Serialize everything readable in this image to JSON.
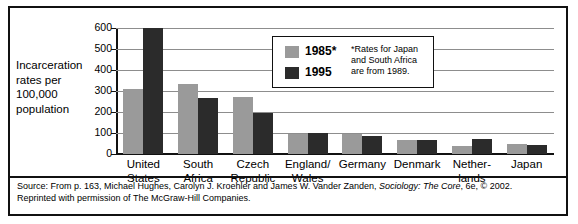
{
  "chart_data": {
    "type": "bar",
    "title": "",
    "xlabel": "",
    "ylabel": "Incarceration rates per 100,000 population",
    "ylim": [
      0,
      600
    ],
    "yticks": [
      0,
      100,
      200,
      300,
      400,
      500,
      600
    ],
    "ytick_labels": [
      "0",
      "100",
      "200",
      "300",
      "400",
      "500",
      "600"
    ],
    "grid": true,
    "legend_position": "inside-top-center",
    "categories": [
      "United States",
      "South Africa",
      "Czech Republic",
      "England/ Wales",
      "Germany",
      "Denmark",
      "Nether- lands",
      "Japan"
    ],
    "category_lines": [
      [
        "United",
        "States"
      ],
      [
        "South",
        "Africa"
      ],
      [
        "Czech",
        "Republic"
      ],
      [
        "England/",
        "Wales"
      ],
      [
        "Germany",
        ""
      ],
      [
        "Denmark",
        ""
      ],
      [
        "Nether-",
        "lands"
      ],
      [
        "Japan",
        ""
      ]
    ],
    "series": [
      {
        "name": "1985*",
        "color": "#9a9a9a",
        "values": [
          310,
          335,
          270,
          95,
          95,
          68,
          40,
          50
        ]
      },
      {
        "name": "1995",
        "color": "#2b2b2b",
        "values": [
          600,
          265,
          195,
          100,
          88,
          68,
          72,
          42
        ]
      }
    ],
    "annotations": [
      "*Rates for Japan and South Africa are from 1989."
    ]
  },
  "axis": {
    "y_title": "Incarceration rates per 100,000 population"
  },
  "legend": {
    "entry_1985_label": "1985*",
    "entry_1995_label": "1995",
    "note": "*Rates for Japan and South Africa are from 1989."
  },
  "source": {
    "line1_pre": "Source: From p. 163, Michael Hughes, Carolyn J. Kroehler and James W. Vander Zanden, ",
    "line1_italic": "Sociology: The Core",
    "line1_post": ", 6e, © 2002.",
    "line2": "Reprinted with permission of The McGraw-Hill Companies."
  }
}
